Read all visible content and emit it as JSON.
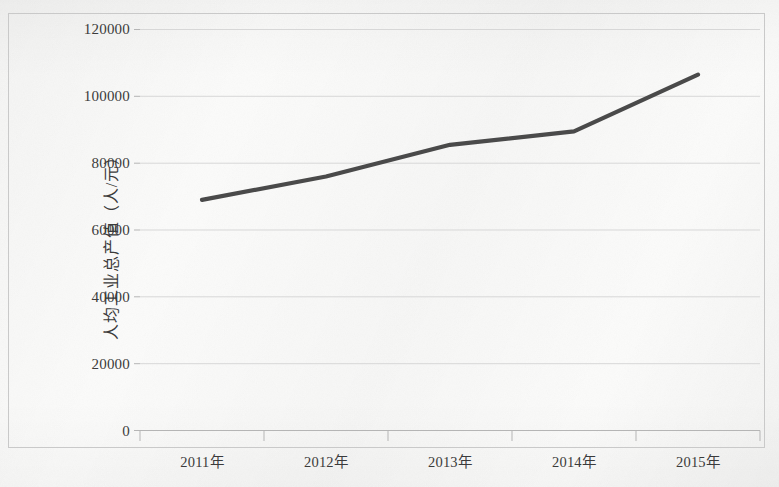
{
  "chart_data": {
    "type": "line",
    "title": "",
    "xlabel": "",
    "ylabel": "人均工业总产值（人/元）",
    "categories": [
      "2011年",
      "2012年",
      "2013年",
      "2014年",
      "2015年"
    ],
    "values": [
      69000,
      76000,
      85500,
      89500,
      106500
    ],
    "series": [
      {
        "name": "人均工业总产值",
        "values": [
          69000,
          76000,
          85500,
          89500,
          106500
        ]
      }
    ],
    "ylim": [
      0,
      120000
    ],
    "y_ticks": [
      0,
      20000,
      40000,
      60000,
      80000,
      100000,
      120000
    ],
    "y_tick_labels": [
      "0",
      "20000",
      "40000",
      "60000",
      "80000",
      "100000",
      "120000"
    ],
    "grid": true,
    "grid_axis": "y",
    "legend": false,
    "legend_position": "none",
    "markers": false,
    "line_color": "#4a4a4a",
    "grid_color": "#d4d4d4",
    "axis_color": "#bdbdbd",
    "text_color": "#3b3b3b",
    "background_color": "#fbfbfa"
  },
  "axis": {
    "y_title": "人均工业总产值（人/元）",
    "y_labels": [
      "120000",
      "100000",
      "80000",
      "60000",
      "40000",
      "20000",
      "0"
    ],
    "x_labels": [
      "2011年",
      "2012年",
      "2013年",
      "2014年",
      "2015年"
    ]
  }
}
